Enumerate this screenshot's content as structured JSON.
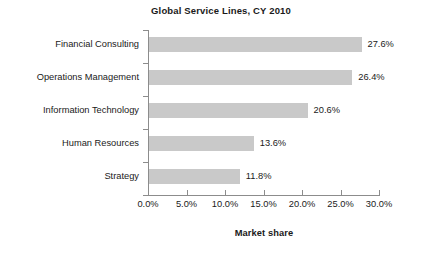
{
  "chart_data": {
    "type": "bar",
    "orientation": "horizontal",
    "title": "Global Service Lines, CY 2010",
    "xlabel": "Market share",
    "ylabel": "",
    "categories": [
      "Financial Consulting",
      "Operations Management",
      "Information Technology",
      "Human Resources",
      "Strategy"
    ],
    "values": [
      27.6,
      26.4,
      20.6,
      13.6,
      11.8
    ],
    "value_labels": [
      "27.6%",
      "26.4%",
      "20.6%",
      "13.6%",
      "11.8%"
    ],
    "xlim": [
      0,
      30
    ],
    "xticks": [
      0,
      5,
      10,
      15,
      20,
      25,
      30
    ],
    "xtick_labels": [
      "0.0%",
      "5.0%",
      "10.0%",
      "15.0%",
      "20.0%",
      "25.0%",
      "30.0%"
    ],
    "grid": false,
    "legend": null,
    "bar_color": "#c9c9c9",
    "axis_color": "#8c8c8c",
    "text_color": "#1a1a1a",
    "background": "#ffffff"
  }
}
